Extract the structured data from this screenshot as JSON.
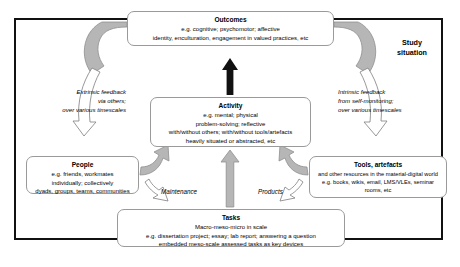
{
  "diagram": {
    "frame_label": "Study\nsituation",
    "frame_label_line1": "Study",
    "frame_label_line2": "situation",
    "colors": {
      "frame_border": "#111111",
      "node_border": "#9a9a9a",
      "node_fill": "#ffffff",
      "arrow_gray_fill": "#b3b3b3",
      "arrow_gray_stroke": "#8c8c8c",
      "arrow_black": "#111111",
      "background": "#ffffff"
    }
  },
  "nodes": {
    "outcomes": {
      "title": "Outcomes",
      "lines": [
        "e.g. cognitive; psychomotor; affective",
        "identity, enculturation, engagement in valued practices, etc"
      ]
    },
    "activity": {
      "title": "Activity",
      "lines": [
        "e.g. mental; physical",
        "problem-solving; reflective",
        "with/without others; with/without tools/artefacts",
        "heavily situated or abstracted, etc"
      ]
    },
    "tasks": {
      "title": "Tasks",
      "lines": [
        "Macro-meso-micro in scale",
        "e.g. dissertation project; essay; lab report; answering a question",
        "embedded meso-scale assessed tasks as key devices"
      ]
    },
    "people": {
      "title": "People",
      "lines": [
        "e.g. friends, workmates",
        "individually; collectively",
        "dyads, groups, teams, communities"
      ]
    },
    "tools": {
      "title": "Tools, artefacts",
      "lines": [
        "and other resources in the material-digital world",
        "e.g. books, wikis, email, LMS/VLEs, seminar",
        "rooms, etc"
      ]
    }
  },
  "annotations": {
    "extrinsic_feedback": {
      "lines": [
        "Extrinsic feedback",
        "via others;",
        "over various timescales"
      ]
    },
    "intrinsic_feedback": {
      "lines": [
        "Intrinsic feedback",
        "from self-monitoring;",
        "over various timescales"
      ]
    },
    "maintenance": "Maintenance",
    "products": "Products"
  }
}
